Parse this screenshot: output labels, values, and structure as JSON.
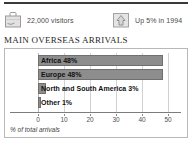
{
  "header": {
    "stats": [
      {
        "id": "visitors",
        "icon": "suitcase-icon",
        "text": "22,000 visitors"
      },
      {
        "id": "trend",
        "icon": "up-arrow-icon",
        "text": "Up 5% in 1994"
      }
    ]
  },
  "chart_title": "MAIN OVERSEAS ARRIVALS",
  "colors": {
    "bar_fill": "#8d8d8d",
    "bar_stroke": "#6f6f6f",
    "gridline": "#d2d2d2",
    "frame": "#b8b8b8",
    "rule": "#3a3a3a"
  },
  "chart_data": {
    "type": "bar",
    "orientation": "horizontal",
    "title": "MAIN OVERSEAS ARRIVALS",
    "xlabel": "% of total arrivals",
    "ylabel": "",
    "xlim": [
      0,
      55
    ],
    "grid": true,
    "legend": false,
    "categories": [
      "Africa",
      "Europe",
      "North and South America",
      "Other"
    ],
    "values": [
      48,
      48,
      3,
      1
    ],
    "bar_labels": [
      "Africa 48%",
      "Europe 48%",
      "North and South America 3%",
      "Other 1%"
    ],
    "xticks": [
      0,
      10,
      20,
      30,
      40,
      50
    ],
    "xticklabels": [
      "0",
      "10",
      "20",
      "30",
      "40",
      "50"
    ]
  }
}
